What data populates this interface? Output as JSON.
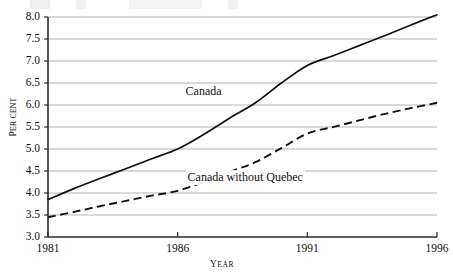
{
  "chart_data": {
    "type": "line",
    "title": "",
    "xlabel": "Year",
    "ylabel": "Per cent",
    "xlim": [
      1981,
      1996
    ],
    "ylim": [
      3.0,
      8.0
    ],
    "grid": true,
    "legend_position": "inline-annotation",
    "x_ticks": [
      "1981",
      "1986",
      "1991",
      "1996"
    ],
    "x_tick_values": [
      1981,
      1986,
      1991,
      1996
    ],
    "y_ticks": [
      "3.0",
      "3.5",
      "4.0",
      "4.5",
      "5.0",
      "5.5",
      "6.0",
      "6.5",
      "7.0",
      "7.5",
      "8.0"
    ],
    "y_tick_values": [
      3.0,
      3.5,
      4.0,
      4.5,
      5.0,
      5.5,
      6.0,
      6.5,
      7.0,
      7.5,
      8.0
    ],
    "x": [
      1981,
      1982,
      1983,
      1984,
      1985,
      1986,
      1987,
      1988,
      1989,
      1990,
      1991,
      1992,
      1993,
      1994,
      1995,
      1996
    ],
    "series": [
      {
        "name": "Canada",
        "style": "solid",
        "color": "#111111",
        "values": [
          3.85,
          4.1,
          4.33,
          4.55,
          4.78,
          5.0,
          5.33,
          5.7,
          6.05,
          6.5,
          6.9,
          7.12,
          7.35,
          7.58,
          7.82,
          8.05
        ]
      },
      {
        "name": "Canada without Quebec",
        "style": "dashed",
        "color": "#111111",
        "values": [
          3.45,
          3.57,
          3.7,
          3.82,
          3.94,
          4.05,
          4.25,
          4.48,
          4.7,
          5.02,
          5.35,
          5.5,
          5.65,
          5.8,
          5.93,
          6.05
        ]
      }
    ],
    "annotations": [
      {
        "text": "Canada",
        "x": 1987.0,
        "y": 6.3
      },
      {
        "text": "Canada without Quebec",
        "x": 1988.6,
        "y": 4.35
      }
    ]
  },
  "axis": {
    "y_label_small_caps_lead": "P",
    "y_label_small_caps_rest": "ER CENT",
    "x_label_small_caps_lead": "Y",
    "x_label_small_caps_rest": "EAR"
  },
  "colors": {
    "line": "#111111",
    "grid": "#b4b4b4",
    "axis": "#2a2a2a",
    "background": "#ffffff",
    "text": "#111111"
  }
}
